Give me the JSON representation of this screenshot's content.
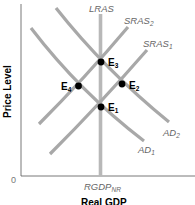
{
  "diagram": {
    "x_axis_title": "Real GDP",
    "y_axis_title": "Price Level",
    "origin_label": "0",
    "x_tick_label": {
      "main": "RGDP",
      "sub": "NR"
    },
    "curves": [
      {
        "id": "lras",
        "label": "LRAS",
        "sub": ""
      },
      {
        "id": "sras2",
        "label": "SRAS",
        "sub": "2"
      },
      {
        "id": "sras1",
        "label": "SRAS",
        "sub": "1"
      },
      {
        "id": "ad2",
        "label": "AD",
        "sub": "2"
      },
      {
        "id": "ad1",
        "label": "AD",
        "sub": "1"
      }
    ],
    "points": [
      {
        "id": "e1",
        "label": "E",
        "sub": "1"
      },
      {
        "id": "e2",
        "label": "E",
        "sub": "2"
      },
      {
        "id": "e3",
        "label": "E",
        "sub": "3"
      },
      {
        "id": "e4",
        "label": "E",
        "sub": "4"
      }
    ],
    "colors": {
      "curve": "#a8a8a8",
      "point": "#000000",
      "axis": "#555555"
    }
  }
}
